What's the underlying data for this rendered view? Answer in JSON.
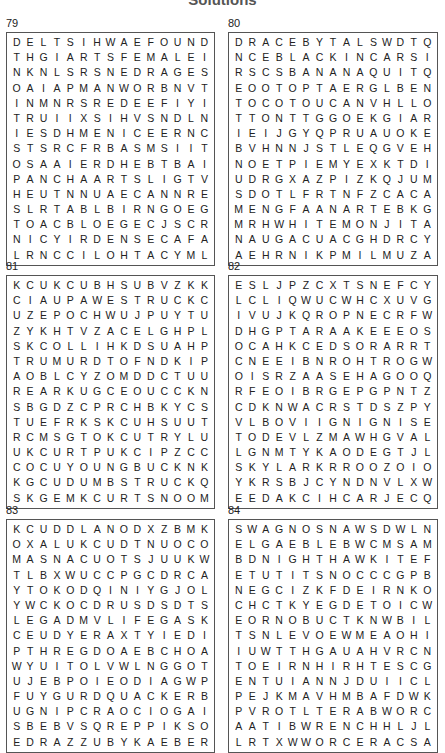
{
  "page": {
    "heading": "Solutions"
  },
  "puzzles": [
    {
      "number": "79",
      "rows": [
        "DELTSIHWAEFOUND",
        "THGIARTSFEMALEI",
        "NKNLSRSNEDRAGES",
        "OAIAPMANWORBNVT",
        "INMNRSREDEEFIYI",
        "TRUIIXSIHVSNDLN",
        "IESDHMENICEERNC",
        "STSRCFRBASMSIIT",
        "OSAAIERDHEBTBAI",
        "PANCHAARTSLIGTV",
        "HEUTNNUAECANNRE",
        "SLRTABLBIRNGOEG",
        "TOACBLOEGECJSCR",
        "NICYIRDENSECAFA",
        "LRNCCILOHTACYML"
      ]
    },
    {
      "number": "80",
      "rows": [
        "DRACEBYTALSWDTQ",
        "NCEBLACKINCARSI",
        "RSCSBANANAQUITQ",
        "EOOTOPTAERGLBEN",
        "TOCOTOUCANVHLLO",
        "TTONTTGGOEKGIAR",
        "IEIJGYQPRUAUOKE",
        "BVHNNJSTLEQGVEH",
        "NOETPIEMYEXKTDI",
        "UDRGXAZPIZKQJUM",
        "SDOTLFRTNFZCACA",
        "MENGFAANARTEBKG",
        "MRHWHITEMONJITA",
        "NAUGACUACGHDRCY",
        "AEHRNIKPMILMUZA"
      ]
    },
    {
      "number": "81",
      "rows": [
        "KCUKCUBHSUBVZKK",
        "CIAUPAWESTRUCKC",
        "UZEPOCHWUJPUYTU",
        "ZYKHTVZACELGHPL",
        "SKCOLLIHKDSUAHP",
        "TRUMURDTOFNDKIP",
        "AOBLCYZOMDDCTUU",
        "REARKUGCEOUCCKN",
        "SBGDZCPRCHBKYCS",
        "TUEFRKSKCUHSUUT",
        "RCMSGTOKCUTRYLU",
        "UKCURTPUKCIPZCC",
        "COCUYOUNGBUCKNK",
        "KGCUDUMBSTRUCKQ",
        "SKGEMKCURTSNOOM"
      ]
    },
    {
      "number": "82",
      "rows": [
        "ESLJPZCXTSNEFCY",
        "LCLIQWUCWHCXUVG",
        "IVUJKQROPNECRFW",
        "DHGPTARAAKEEEOS",
        "OCAHKCEDSORARRT",
        "CNEEIBNROHTROGW",
        "OISRZAASEHAGOOQ",
        "RFEOIBRGEPGPNTZ",
        "CDKNWACRSTDSZPY",
        "VLBOVIIGNIGNISE",
        "TODEVLZMAWHGVAL",
        "LGNMTYKAODEGTJL",
        "SKYLARKRROOZOIO",
        "YKRSBJCYNDNVLXW",
        "EEDAKCIHCARJECQ"
      ]
    },
    {
      "number": "83",
      "rows": [
        "KCUDDLANODXZBMK",
        "OXALUKCUDTNUOCO",
        "MASNACUOTSJUUKW",
        "TLBXWUCCPGCDRCA",
        "YTOKODQINIYGJOL",
        "YWCKOCDRUSDSDTS",
        "LEGADMVLIFEGASK",
        "CEUDYERAXTYIEDI",
        "PTHREGDOAEBCHOA",
        "WYUITOLVWLNGGOT",
        "UJEBPOIEODIAGWP",
        "FUYGURDQUACKERB",
        "UGNIPCRAOCIOGAI",
        "SBEBVSQREPPIKSO",
        "EDRAZZUBYKAEBER"
      ]
    },
    {
      "number": "84",
      "rows": [
        "SWAGNOSNAWSDWLN",
        "ELGAEBLEBWCMSAM",
        "BDNIGHTHAWKITEF",
        "ETUTITSNOCCCGPB",
        "NEGCIZKFDEIRNKO",
        "CHCTKYEGDETOICW",
        "EORNOBUCTKNWBIL",
        "TSNLEVOEWMEAOHI",
        "IUWTTHGAUAHVRCN",
        "TOEIRNHIRHTESCG",
        "ENTUIANNJDUIICL",
        "PEJKMAVHMBAFDWK",
        "PVROTLTERABWORC",
        "AATIBWRENCHHLJL",
        "LRTXWWORCERACSA"
      ]
    }
  ]
}
